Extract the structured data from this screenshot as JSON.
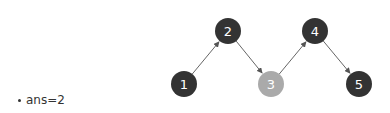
{
  "diagram": {
    "nodes": [
      {
        "id": "1",
        "label": "1",
        "x": 184,
        "y": 84,
        "fill": "#333333",
        "text_color": "#ffffff"
      },
      {
        "id": "2",
        "label": "2",
        "x": 228,
        "y": 31,
        "fill": "#333333",
        "text_color": "#ffffff"
      },
      {
        "id": "3",
        "label": "3",
        "x": 271,
        "y": 84,
        "fill": "#aaaaaa",
        "text_color": "#ffffff"
      },
      {
        "id": "4",
        "label": "4",
        "x": 315,
        "y": 31,
        "fill": "#333333",
        "text_color": "#ffffff"
      },
      {
        "id": "5",
        "label": "5",
        "x": 359,
        "y": 84,
        "fill": "#333333",
        "text_color": "#ffffff"
      }
    ],
    "edges": [
      {
        "from": "1",
        "to": "2"
      },
      {
        "from": "2",
        "to": "3"
      },
      {
        "from": "3",
        "to": "4"
      },
      {
        "from": "4",
        "to": "5"
      }
    ],
    "edge_color": "#666666"
  },
  "caption": {
    "text": "ans=2"
  }
}
